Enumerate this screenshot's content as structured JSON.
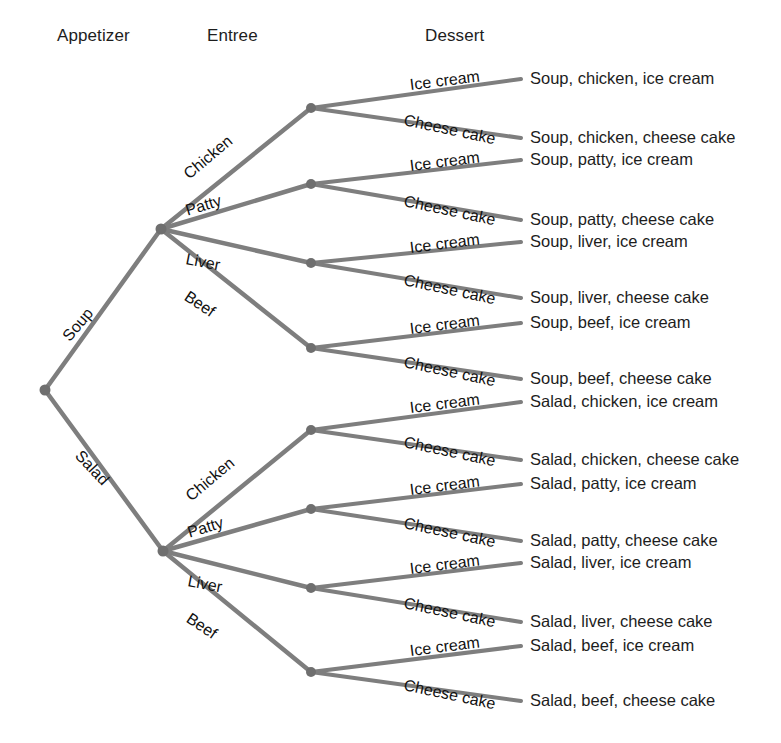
{
  "diagram": {
    "type": "tree",
    "colors": {
      "background": "#ffffff",
      "branch": "#7e7e7e",
      "node": "#6f6f6f",
      "text": "#1d1d1d"
    },
    "headers": [
      {
        "label": "Appetizer",
        "x": 57,
        "y": 26
      },
      {
        "label": "Entree",
        "x": 207,
        "y": 26
      },
      {
        "label": "Dessert",
        "x": 425,
        "y": 26
      }
    ],
    "root": {
      "x": 45,
      "y": 390
    },
    "appetizer_edges": [
      {
        "label": "Soup",
        "x": 66,
        "y": 331,
        "angle": -50
      },
      {
        "label": "Salad",
        "x": 78,
        "y": 445,
        "angle": 47
      }
    ],
    "entree_labels": [
      "Chicken",
      "Patty",
      "Liver",
      "Beef"
    ],
    "dessert_labels": [
      "Ice cream",
      "Cheese cake"
    ],
    "groups": [
      {
        "appetizer": "Soup",
        "hub": {
          "x": 161,
          "y": 229
        },
        "entrees": [
          {
            "name": "Chicken",
            "node": {
              "x": 311,
              "y": 108
            },
            "edge_label": {
              "x": 186,
              "y": 168,
              "angle": -40
            },
            "desserts": [
              {
                "name": "Ice cream",
                "label_x": 410,
                "label_y": 77,
                "label_angle": -7,
                "tip_x": 521,
                "tip_y": 79
              },
              {
                "name": "Cheese cake",
                "label_x": 404,
                "label_y": 112,
                "label_angle": 12,
                "tip_x": 521,
                "tip_y": 138
              }
            ]
          },
          {
            "name": "Patty",
            "node": {
              "x": 311,
              "y": 184
            },
            "edge_label": {
              "x": 186,
              "y": 203,
              "angle": -17
            },
            "desserts": [
              {
                "name": "Ice cream",
                "label_x": 410,
                "label_y": 158,
                "label_angle": -7,
                "tip_x": 521,
                "tip_y": 160
              },
              {
                "name": "Cheese cake",
                "label_x": 404,
                "label_y": 193,
                "label_angle": 12,
                "tip_x": 521,
                "tip_y": 220
              }
            ]
          },
          {
            "name": "Liver",
            "node": {
              "x": 311,
              "y": 263
            },
            "edge_label": {
              "x": 186,
              "y": 251,
              "angle": 11
            },
            "desserts": [
              {
                "name": "Ice cream",
                "label_x": 410,
                "label_y": 240,
                "label_angle": -7,
                "tip_x": 521,
                "tip_y": 242
              },
              {
                "name": "Cheese cake",
                "label_x": 404,
                "label_y": 272,
                "label_angle": 12,
                "tip_x": 521,
                "tip_y": 298
              }
            ]
          },
          {
            "name": "Beef",
            "node": {
              "x": 311,
              "y": 348
            },
            "edge_label": {
              "x": 186,
              "y": 287,
              "angle": 34
            },
            "desserts": [
              {
                "name": "Ice cream",
                "label_x": 410,
                "label_y": 321,
                "label_angle": -7,
                "tip_x": 521,
                "tip_y": 323
              },
              {
                "name": "Cheese cake",
                "label_x": 404,
                "label_y": 354,
                "label_angle": 12,
                "tip_x": 521,
                "tip_y": 379
              }
            ]
          }
        ]
      },
      {
        "appetizer": "Salad",
        "hub": {
          "x": 163,
          "y": 551
        },
        "entrees": [
          {
            "name": "Chicken",
            "node": {
              "x": 311,
              "y": 430
            },
            "edge_label": {
              "x": 188,
              "y": 490,
              "angle": -40
            },
            "desserts": [
              {
                "name": "Ice cream",
                "label_x": 410,
                "label_y": 400,
                "label_angle": -7,
                "tip_x": 521,
                "tip_y": 402
              },
              {
                "name": "Cheese cake",
                "label_x": 404,
                "label_y": 434,
                "label_angle": 12,
                "tip_x": 521,
                "tip_y": 460
              }
            ]
          },
          {
            "name": "Patty",
            "node": {
              "x": 311,
              "y": 509
            },
            "edge_label": {
              "x": 188,
              "y": 525,
              "angle": -17
            },
            "desserts": [
              {
                "name": "Ice cream",
                "label_x": 410,
                "label_y": 482,
                "label_angle": -7,
                "tip_x": 521,
                "tip_y": 484
              },
              {
                "name": "Cheese cake",
                "label_x": 404,
                "label_y": 515,
                "label_angle": 12,
                "tip_x": 521,
                "tip_y": 541
              }
            ]
          },
          {
            "name": "Liver",
            "node": {
              "x": 311,
              "y": 588
            },
            "edge_label": {
              "x": 188,
              "y": 573,
              "angle": 11
            },
            "desserts": [
              {
                "name": "Ice cream",
                "label_x": 410,
                "label_y": 561,
                "label_angle": -7,
                "tip_x": 521,
                "tip_y": 563
              },
              {
                "name": "Cheese cake",
                "label_x": 404,
                "label_y": 595,
                "label_angle": 12,
                "tip_x": 521,
                "tip_y": 622
              }
            ]
          },
          {
            "name": "Beef",
            "node": {
              "x": 311,
              "y": 672
            },
            "edge_label": {
              "x": 188,
              "y": 609,
              "angle": 34
            },
            "desserts": [
              {
                "name": "Ice cream",
                "label_x": 410,
                "label_y": 643,
                "label_angle": -7,
                "tip_x": 521,
                "tip_y": 646
              },
              {
                "name": "Cheese cake",
                "label_x": 404,
                "label_y": 677,
                "label_angle": 12,
                "tip_x": 521,
                "tip_y": 701
              }
            ]
          }
        ]
      }
    ],
    "outcomes": [
      {
        "text": "Soup, chicken, ice cream",
        "x": 530,
        "y": 78
      },
      {
        "text": "Soup, chicken, cheese cake",
        "x": 530,
        "y": 137
      },
      {
        "text": "Soup, patty, ice cream",
        "x": 530,
        "y": 159
      },
      {
        "text": "Soup, patty, cheese cake",
        "x": 530,
        "y": 219
      },
      {
        "text": "Soup, liver, ice cream",
        "x": 530,
        "y": 241
      },
      {
        "text": "Soup, liver, cheese cake",
        "x": 530,
        "y": 297
      },
      {
        "text": "Soup, beef, ice cream",
        "x": 530,
        "y": 322
      },
      {
        "text": "Soup, beef, cheese cake",
        "x": 530,
        "y": 378
      },
      {
        "text": "Salad, chicken, ice cream",
        "x": 530,
        "y": 401
      },
      {
        "text": "Salad, chicken, cheese cake",
        "x": 530,
        "y": 459
      },
      {
        "text": "Salad, patty, ice cream",
        "x": 530,
        "y": 483
      },
      {
        "text": "Salad, patty, cheese cake",
        "x": 530,
        "y": 540
      },
      {
        "text": "Salad, liver, ice cream",
        "x": 530,
        "y": 562
      },
      {
        "text": "Salad, liver, cheese cake",
        "x": 530,
        "y": 621
      },
      {
        "text": "Salad, beef, ice cream",
        "x": 530,
        "y": 645
      },
      {
        "text": "Salad, beef, cheese cake",
        "x": 530,
        "y": 700
      }
    ]
  }
}
